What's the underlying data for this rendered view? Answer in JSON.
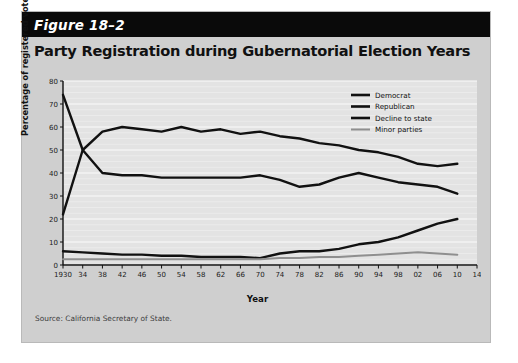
{
  "figure": {
    "label": "Figure 18–2",
    "title": "Party Registration during Gubernatorial Election Years",
    "source": "Source: California Secretary of State."
  },
  "colors": {
    "card_background": "#cfcfcf",
    "header_background": "#0a0a0a",
    "header_text": "#ffffff",
    "plot_background": "#e3e3e3",
    "gridline": "#f4f4f4",
    "democrat": "#111111",
    "republican": "#111111",
    "decline_to_state": "#111111",
    "minor_parties": "#8f8f8f"
  },
  "chart_data": {
    "type": "line",
    "title": "Party Registration during Gubernatorial Election Years",
    "xlabel": "Year",
    "ylabel": "Percentage of registered voters",
    "xlim": [
      1930,
      2014
    ],
    "ylim": [
      0,
      80
    ],
    "ytick_step": 10,
    "grid": true,
    "legend_position": "top-right",
    "x": [
      1930,
      1934,
      1938,
      1942,
      1946,
      1950,
      1954,
      1958,
      1962,
      1966,
      1970,
      1974,
      1978,
      1982,
      1986,
      1990,
      1994,
      1998,
      2002,
      2006,
      2010
    ],
    "xtick_labels": [
      "1930",
      "34",
      "38",
      "42",
      "46",
      "50",
      "54",
      "58",
      "62",
      "66",
      "70",
      "74",
      "78",
      "82",
      "86",
      "90",
      "94",
      "98",
      "02",
      "06",
      "10",
      "14"
    ],
    "ytick_labels": [
      "0",
      "10",
      "20",
      "30",
      "40",
      "50",
      "60",
      "70",
      "80"
    ],
    "series": [
      {
        "name": "Democrat",
        "color": "#111111",
        "values": [
          22,
          50,
          58,
          60,
          59,
          58,
          60,
          58,
          59,
          57,
          58,
          56,
          55,
          53,
          52,
          50,
          49,
          47,
          44,
          43,
          44
        ]
      },
      {
        "name": "Republican",
        "color": "#111111",
        "values": [
          74,
          50,
          40,
          39,
          39,
          38,
          38,
          38,
          38,
          38,
          39,
          37,
          34,
          35,
          38,
          40,
          38,
          36,
          35,
          34,
          31
        ]
      },
      {
        "name": "Decline to state",
        "color": "#111111",
        "values": [
          6,
          5.5,
          5,
          4.5,
          4.5,
          4,
          4,
          3.5,
          3.5,
          3.5,
          3,
          5,
          6,
          6,
          7,
          9,
          10,
          12,
          15,
          18,
          20
        ]
      },
      {
        "name": "Minor parties",
        "color": "#8f8f8f",
        "values": [
          2.5,
          2.5,
          2.5,
          2.5,
          2.5,
          2.5,
          2.5,
          2.5,
          2.5,
          2.5,
          2.5,
          3,
          3,
          3.5,
          3.5,
          4,
          4.5,
          5,
          5.5,
          5,
          4.5
        ]
      }
    ]
  }
}
